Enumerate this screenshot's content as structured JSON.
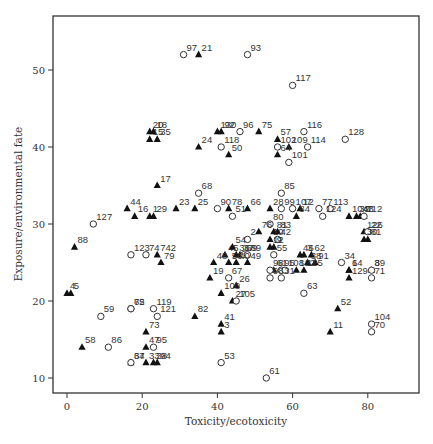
{
  "chart_data": {
    "type": "scatter",
    "title": "",
    "xlabel": "Toxicity/ecotoxicity",
    "ylabel": "Exposure/environmental fate",
    "xlim": [
      -4,
      93
    ],
    "ylim": [
      8,
      57
    ],
    "xticks": [
      0,
      20,
      40,
      60,
      80
    ],
    "yticks": [
      10,
      20,
      30,
      40,
      50
    ],
    "grid": false,
    "legend": null,
    "marker_types": {
      "triangle": "filled triangle",
      "circle": "open circle"
    },
    "points": [
      {
        "label": "97",
        "x": 31,
        "y": 52,
        "m": "circle"
      },
      {
        "label": "21",
        "x": 35,
        "y": 52,
        "m": "triangle"
      },
      {
        "label": "93",
        "x": 48,
        "y": 52,
        "m": "circle"
      },
      {
        "label": "117",
        "x": 60,
        "y": 48,
        "m": "circle"
      },
      {
        "label": "20",
        "x": 22,
        "y": 42,
        "m": "triangle"
      },
      {
        "label": "18",
        "x": 23,
        "y": 42,
        "m": "triangle"
      },
      {
        "label": "15",
        "x": 22,
        "y": 41,
        "m": "triangle"
      },
      {
        "label": "35",
        "x": 24,
        "y": 41,
        "m": "triangle"
      },
      {
        "label": "130",
        "x": 40,
        "y": 42,
        "m": "triangle"
      },
      {
        "label": "92",
        "x": 41,
        "y": 42,
        "m": "triangle"
      },
      {
        "label": "96",
        "x": 46,
        "y": 42,
        "m": "circle"
      },
      {
        "label": "75",
        "x": 51,
        "y": 42,
        "m": "triangle"
      },
      {
        "label": "116",
        "x": 63,
        "y": 42,
        "m": "circle"
      },
      {
        "label": "128",
        "x": 74,
        "y": 41,
        "m": "circle"
      },
      {
        "label": "24",
        "x": 35,
        "y": 40,
        "m": "triangle"
      },
      {
        "label": "118",
        "x": 41,
        "y": 40,
        "m": "circle"
      },
      {
        "label": "57",
        "x": 56,
        "y": 41,
        "m": "triangle"
      },
      {
        "label": "102",
        "x": 56,
        "y": 40,
        "m": "circle"
      },
      {
        "label": "109",
        "x": 59,
        "y": 40,
        "m": "triangle"
      },
      {
        "label": "114",
        "x": 64,
        "y": 40,
        "m": "circle"
      },
      {
        "label": "50",
        "x": 43,
        "y": 39,
        "m": "triangle"
      },
      {
        "label": "64",
        "x": 56,
        "y": 39,
        "m": "triangle"
      },
      {
        "label": "101",
        "x": 59,
        "y": 38,
        "m": "circle"
      },
      {
        "label": "17",
        "x": 24,
        "y": 35,
        "m": "triangle"
      },
      {
        "label": "68",
        "x": 35,
        "y": 34,
        "m": "circle"
      },
      {
        "label": "85",
        "x": 57,
        "y": 34,
        "m": "circle"
      },
      {
        "label": "44",
        "x": 16,
        "y": 32,
        "m": "triangle"
      },
      {
        "label": "23",
        "x": 29,
        "y": 32,
        "m": "triangle"
      },
      {
        "label": "25",
        "x": 34,
        "y": 32,
        "m": "triangle"
      },
      {
        "label": "90",
        "x": 40,
        "y": 32,
        "m": "circle"
      },
      {
        "label": "78",
        "x": 43,
        "y": 32,
        "m": "triangle"
      },
      {
        "label": "66",
        "x": 48,
        "y": 32,
        "m": "triangle"
      },
      {
        "label": "28",
        "x": 54,
        "y": 32,
        "m": "triangle"
      },
      {
        "label": "99",
        "x": 57,
        "y": 32,
        "m": "circle"
      },
      {
        "label": "107",
        "x": 60,
        "y": 32,
        "m": "circle"
      },
      {
        "label": "12",
        "x": 62,
        "y": 32,
        "m": "triangle"
      },
      {
        "label": "77",
        "x": 67,
        "y": 32,
        "m": "circle"
      },
      {
        "label": "113",
        "x": 70,
        "y": 32,
        "m": "circle"
      },
      {
        "label": "16",
        "x": 18,
        "y": 31,
        "m": "triangle"
      },
      {
        "label": "1",
        "x": 22,
        "y": 31,
        "m": "triangle"
      },
      {
        "label": "29",
        "x": 23,
        "y": 31,
        "m": "triangle"
      },
      {
        "label": "51",
        "x": 44,
        "y": 31,
        "m": "circle"
      },
      {
        "label": "80",
        "x": 54,
        "y": 30,
        "m": "circle"
      },
      {
        "label": "84",
        "x": 61,
        "y": 31,
        "m": "triangle"
      },
      {
        "label": "124",
        "x": 68,
        "y": 31,
        "m": "circle"
      },
      {
        "label": "104b",
        "x": 75,
        "y": 31,
        "m": "triangle"
      },
      {
        "label": "43",
        "x": 78,
        "y": 31,
        "m": "triangle"
      },
      {
        "label": "7",
        "x": 79,
        "y": 31,
        "m": "triangle"
      },
      {
        "label": "32",
        "x": 77,
        "y": 31,
        "m": "triangle"
      },
      {
        "label": "112",
        "x": 79,
        "y": 31,
        "m": "circle"
      },
      {
        "label": "127",
        "x": 7,
        "y": 30,
        "m": "circle"
      },
      {
        "label": "76",
        "x": 51,
        "y": 29,
        "m": "triangle"
      },
      {
        "label": "81",
        "x": 55,
        "y": 29,
        "m": "triangle"
      },
      {
        "label": "83",
        "x": 56,
        "y": 29,
        "m": "triangle"
      },
      {
        "label": "126",
        "x": 79,
        "y": 29,
        "m": "triangle"
      },
      {
        "label": "22",
        "x": 80,
        "y": 29,
        "m": "circle"
      },
      {
        "label": "88",
        "x": 2,
        "y": 27,
        "m": "triangle"
      },
      {
        "label": "2",
        "x": 48,
        "y": 28,
        "m": "circle"
      },
      {
        "label": "10",
        "x": 54,
        "y": 28,
        "m": "triangle"
      },
      {
        "label": "42",
        "x": 56,
        "y": 28,
        "m": "circle"
      },
      {
        "label": "30",
        "x": 79,
        "y": 28,
        "m": "triangle"
      },
      {
        "label": "81b",
        "x": 80,
        "y": 28,
        "m": "triangle"
      },
      {
        "label": "9",
        "x": 55,
        "y": 27,
        "m": "triangle"
      },
      {
        "label": "12b",
        "x": 54,
        "y": 27,
        "m": "triangle"
      },
      {
        "label": "123",
        "x": 17,
        "y": 26,
        "m": "circle"
      },
      {
        "label": "74",
        "x": 21,
        "y": 26,
        "m": "circle"
      },
      {
        "label": "742",
        "x": 24,
        "y": 26,
        "m": "triangle"
      },
      {
        "label": "79",
        "x": 25,
        "y": 25,
        "m": "triangle"
      },
      {
        "label": "45",
        "x": 42,
        "y": 26,
        "m": "triangle"
      },
      {
        "label": "54",
        "x": 44,
        "y": 27,
        "m": "triangle"
      },
      {
        "label": "36",
        "x": 45,
        "y": 26,
        "m": "triangle"
      },
      {
        "label": "37b",
        "x": 46,
        "y": 26,
        "m": "triangle"
      },
      {
        "label": "69",
        "x": 47,
        "y": 26,
        "m": "circle"
      },
      {
        "label": "89",
        "x": 48,
        "y": 26,
        "m": "circle"
      },
      {
        "label": "48",
        "x": 39,
        "y": 25,
        "m": "triangle"
      },
      {
        "label": "56",
        "x": 43,
        "y": 25,
        "m": "triangle"
      },
      {
        "label": "40",
        "x": 45,
        "y": 25,
        "m": "triangle"
      },
      {
        "label": "49",
        "x": 48,
        "y": 25,
        "m": "triangle"
      },
      {
        "label": "55",
        "x": 55,
        "y": 26,
        "m": "circle"
      },
      {
        "label": "46",
        "x": 62,
        "y": 26,
        "m": "triangle"
      },
      {
        "label": "3b",
        "x": 63,
        "y": 26,
        "m": "triangle"
      },
      {
        "label": "62",
        "x": 65,
        "y": 26,
        "m": "triangle"
      },
      {
        "label": "34",
        "x": 73,
        "y": 25,
        "m": "circle"
      },
      {
        "label": "38b",
        "x": 64,
        "y": 25,
        "m": "triangle"
      },
      {
        "label": "91",
        "x": 66,
        "y": 25,
        "m": "triangle"
      },
      {
        "label": "61b",
        "x": 55,
        "y": 24,
        "m": "triangle"
      },
      {
        "label": "98",
        "x": 54,
        "y": 24,
        "m": "circle"
      },
      {
        "label": "95",
        "x": 57,
        "y": 24,
        "m": "circle"
      },
      {
        "label": "108",
        "x": 58,
        "y": 24,
        "m": "circle"
      },
      {
        "label": "122",
        "x": 61,
        "y": 24,
        "m": "triangle"
      },
      {
        "label": "125",
        "x": 63,
        "y": 24,
        "m": "triangle"
      },
      {
        "label": "6",
        "x": 75,
        "y": 24,
        "m": "triangle"
      },
      {
        "label": "14",
        "x": 75,
        "y": 24,
        "m": "triangle"
      },
      {
        "label": "129",
        "x": 75,
        "y": 23,
        "m": "triangle"
      },
      {
        "label": "8",
        "x": 81,
        "y": 24,
        "m": "triangle"
      },
      {
        "label": "39",
        "x": 81,
        "y": 24,
        "m": "circle"
      },
      {
        "label": "71",
        "x": 81,
        "y": 23,
        "m": "circle"
      },
      {
        "label": "19",
        "x": 38,
        "y": 23,
        "m": "triangle"
      },
      {
        "label": "67",
        "x": 43,
        "y": 23,
        "m": "circle"
      },
      {
        "label": "26",
        "x": 45,
        "y": 22,
        "m": "triangle"
      },
      {
        "label": "98b",
        "x": 54,
        "y": 23,
        "m": "circle"
      },
      {
        "label": "31",
        "x": 57,
        "y": 23,
        "m": "circle"
      },
      {
        "label": "4",
        "x": 0,
        "y": 21,
        "m": "triangle"
      },
      {
        "label": "5",
        "x": 1,
        "y": 21,
        "m": "triangle"
      },
      {
        "label": "63",
        "x": 63,
        "y": 21,
        "m": "circle"
      },
      {
        "label": "100",
        "x": 41,
        "y": 21,
        "m": "triangle"
      },
      {
        "label": "27",
        "x": 44,
        "y": 20,
        "m": "triangle"
      },
      {
        "label": "105",
        "x": 45,
        "y": 20,
        "m": "circle"
      },
      {
        "label": "65",
        "x": 17,
        "y": 19,
        "m": "circle"
      },
      {
        "label": "72",
        "x": 17,
        "y": 19,
        "m": "circle"
      },
      {
        "label": "119",
        "x": 23,
        "y": 19,
        "m": "circle"
      },
      {
        "label": "59",
        "x": 9,
        "y": 18,
        "m": "circle"
      },
      {
        "label": "121",
        "x": 24,
        "y": 18,
        "m": "circle"
      },
      {
        "label": "82",
        "x": 34,
        "y": 18,
        "m": "triangle"
      },
      {
        "label": "52",
        "x": 72,
        "y": 19,
        "m": "triangle"
      },
      {
        "label": "41",
        "x": 41,
        "y": 17,
        "m": "triangle"
      },
      {
        "label": "3",
        "x": 41,
        "y": 16,
        "m": "triangle"
      },
      {
        "label": "104",
        "x": 81,
        "y": 17,
        "m": "circle"
      },
      {
        "label": "70",
        "x": 81,
        "y": 16,
        "m": "circle"
      },
      {
        "label": "73",
        "x": 21,
        "y": 16,
        "m": "triangle"
      },
      {
        "label": "11",
        "x": 70,
        "y": 16,
        "m": "triangle"
      },
      {
        "label": "58",
        "x": 4,
        "y": 14,
        "m": "triangle"
      },
      {
        "label": "86",
        "x": 11,
        "y": 14,
        "m": "circle"
      },
      {
        "label": "47",
        "x": 21,
        "y": 14,
        "m": "triangle"
      },
      {
        "label": "95b",
        "x": 23,
        "y": 14,
        "m": "circle"
      },
      {
        "label": "37",
        "x": 17,
        "y": 12,
        "m": "triangle"
      },
      {
        "label": "64b",
        "x": 17,
        "y": 12,
        "m": "circle"
      },
      {
        "label": "33",
        "x": 21,
        "y": 12,
        "m": "triangle"
      },
      {
        "label": "38",
        "x": 23,
        "y": 12,
        "m": "triangle"
      },
      {
        "label": "94",
        "x": 24,
        "y": 12,
        "m": "triangle"
      },
      {
        "label": "53",
        "x": 41,
        "y": 12,
        "m": "circle"
      },
      {
        "label": "61",
        "x": 53,
        "y": 10,
        "m": "circle"
      }
    ]
  },
  "axes": {
    "xlabel": "Toxicity/ecotoxicity",
    "ylabel": "Exposure/environmental fate",
    "xticks": [
      "0",
      "20",
      "40",
      "60",
      "80"
    ],
    "yticks": [
      "10",
      "20",
      "30",
      "40",
      "50"
    ]
  }
}
